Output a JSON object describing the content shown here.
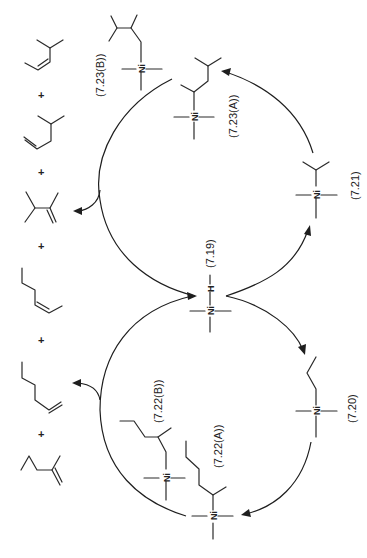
{
  "figure": {
    "orientation": "rotated 90 degrees clockwise"
  },
  "atoms": {
    "nickel": "Ni",
    "hydrogen": "H"
  },
  "compounds": {
    "c7_19": {
      "label": "(7.19)",
      "species": "Ni-H catalyst"
    },
    "c7_20": {
      "label": "(7.20)",
      "species": "n-propyl-Ni"
    },
    "c7_21": {
      "label": "(7.21)",
      "species": "isopropyl-Ni"
    },
    "c7_22A": {
      "label": "(7.22(A))",
      "species": "2-methylpentyl-Ni (secondary)"
    },
    "c7_22B": {
      "label": "(7.22(B))",
      "species": "2-methylpentyl-Ni (primary)"
    },
    "c7_23A": {
      "label": "(7.23(A))",
      "species": "2,3-dimethylbutyl-Ni (from isopropyl)"
    },
    "c7_23B": {
      "label": "(7.23(B))",
      "species": "2,3-dimethylbutyl-Ni (primary)"
    }
  },
  "products": {
    "plus": "+",
    "items": [
      "4-methyl-2-pentene",
      "4-methyl-1-pentene",
      "2,3-dimethyl-1-butene",
      "2-hexene",
      "1-hexene",
      "2-methyl-1-pentene"
    ]
  }
}
